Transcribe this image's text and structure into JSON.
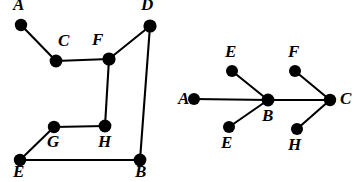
{
  "figure": {
    "background_color": "#ffffff",
    "ink_color": "#000000",
    "width": 354,
    "height": 182
  },
  "graphs": [
    {
      "id": "left-graph",
      "name": "left-graph",
      "node_count": 8,
      "edge_count": 8,
      "nodes": [
        {
          "id": "A",
          "label": "A",
          "cx": 21,
          "cy": 25,
          "r": 6.2,
          "label_x": 13,
          "label_y": -4
        },
        {
          "id": "D",
          "label": "D",
          "cx": 150,
          "cy": 26,
          "r": 6.6,
          "label_x": 141,
          "label_y": -4
        },
        {
          "id": "C",
          "label": "C",
          "cx": 56,
          "cy": 61,
          "r": 6.4,
          "label_x": 58,
          "label_y": 32
        },
        {
          "id": "F",
          "label": "F",
          "cx": 109,
          "cy": 59,
          "r": 6.6,
          "label_x": 92,
          "label_y": 31
        },
        {
          "id": "G",
          "label": "G",
          "cx": 54,
          "cy": 127,
          "r": 6.2,
          "label_x": 47,
          "label_y": 133
        },
        {
          "id": "H",
          "label": "H",
          "cx": 105,
          "cy": 126,
          "r": 6.4,
          "label_x": 98,
          "label_y": 133
        },
        {
          "id": "E",
          "label": "E",
          "cx": 20,
          "cy": 160,
          "r": 6.2,
          "label_x": 13,
          "label_y": 163
        },
        {
          "id": "B",
          "label": "B",
          "cx": 140,
          "cy": 160,
          "r": 6.4,
          "label_x": 135,
          "label_y": 163
        }
      ],
      "edges": [
        {
          "from": "A",
          "to": "C"
        },
        {
          "from": "C",
          "to": "F"
        },
        {
          "from": "F",
          "to": "D"
        },
        {
          "from": "D",
          "to": "B"
        },
        {
          "from": "F",
          "to": "H"
        },
        {
          "from": "H",
          "to": "G"
        },
        {
          "from": "G",
          "to": "E"
        },
        {
          "from": "E",
          "to": "B"
        }
      ]
    },
    {
      "id": "right-graph",
      "name": "right-graph",
      "node_count": 7,
      "edge_count": 6,
      "nodes": [
        {
          "id": "A",
          "label": "A",
          "cx": 194,
          "cy": 99,
          "r": 6.0,
          "label_x": 178,
          "label_y": 90
        },
        {
          "id": "E1",
          "label": "E",
          "cx": 232,
          "cy": 71,
          "r": 6.0,
          "label_x": 225,
          "label_y": 43
        },
        {
          "id": "E2",
          "label": "E",
          "cx": 229,
          "cy": 127,
          "r": 6.0,
          "label_x": 221,
          "label_y": 134
        },
        {
          "id": "B",
          "label": "B",
          "cx": 268,
          "cy": 100,
          "r": 6.4,
          "label_x": 262,
          "label_y": 107
        },
        {
          "id": "F",
          "label": "F",
          "cx": 295,
          "cy": 71,
          "r": 6.0,
          "label_x": 288,
          "label_y": 43
        },
        {
          "id": "H",
          "label": "H",
          "cx": 297,
          "cy": 129,
          "r": 6.0,
          "label_x": 288,
          "label_y": 136
        },
        {
          "id": "C",
          "label": "C",
          "cx": 330,
          "cy": 100,
          "r": 6.2,
          "label_x": 340,
          "label_y": 90
        }
      ],
      "edges": [
        {
          "from": "A",
          "to": "B"
        },
        {
          "from": "E1",
          "to": "B"
        },
        {
          "from": "E2",
          "to": "B"
        },
        {
          "from": "B",
          "to": "C"
        },
        {
          "from": "F",
          "to": "C"
        },
        {
          "from": "H",
          "to": "C"
        }
      ]
    }
  ]
}
